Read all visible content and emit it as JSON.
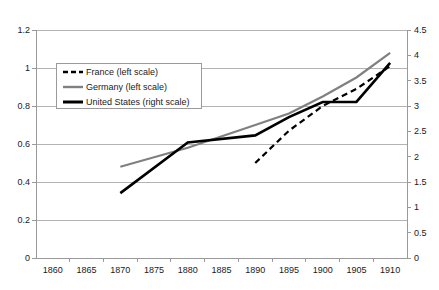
{
  "chart_data": {
    "type": "line",
    "title": "",
    "xlabel": "",
    "ylabel": "",
    "grid": true,
    "legend_position": "inside-upper-left",
    "x_axis": {
      "categories": [
        "1860",
        "1865",
        "1870",
        "1875",
        "1880",
        "1885",
        "1890",
        "1895",
        "1900",
        "1905",
        "1910"
      ],
      "tick_style": "between-categories"
    },
    "y_axis_left": {
      "label": "",
      "min": 0,
      "max": 1.2,
      "step": 0.2,
      "ticks": [
        "0",
        "0.2",
        "0.4",
        "0.6",
        "0.8",
        "1",
        "1.2"
      ]
    },
    "y_axis_right": {
      "label": "",
      "min": 0,
      "max": 4.5,
      "step": 0.5,
      "ticks": [
        "0",
        "0.5",
        "1",
        "1.5",
        "2",
        "2.5",
        "3",
        "3.5",
        "4",
        "4.5"
      ]
    },
    "series": [
      {
        "name": "France (left scale)",
        "axis": "left",
        "style": "dashed",
        "color": "#000000",
        "width": 2.2,
        "x": [
          1890,
          1895,
          1900,
          1905,
          1910
        ],
        "values": [
          0.5,
          0.67,
          0.8,
          0.89,
          1.01
        ]
      },
      {
        "name": "Germany (left scale)",
        "axis": "left",
        "style": "solid",
        "color": "#808080",
        "width": 2.2,
        "x": [
          1870,
          1880,
          1890,
          1895,
          1900,
          1905,
          1910
        ],
        "values": [
          0.48,
          0.58,
          0.7,
          0.76,
          0.85,
          0.95,
          1.08
        ]
      },
      {
        "name": "United States (right scale)",
        "axis": "right",
        "style": "solid",
        "color": "#000000",
        "width": 2.6,
        "x": [
          1870,
          1880,
          1890,
          1895,
          1900,
          1905,
          1910
        ],
        "values": [
          1.28,
          2.28,
          2.42,
          2.78,
          3.08,
          3.08,
          3.85
        ]
      }
    ]
  },
  "legend": {
    "items": [
      {
        "label": "France (left scale)",
        "icon": "dashed-line-swatch"
      },
      {
        "label": "Germany (left scale)",
        "icon": "gray-line-swatch"
      },
      {
        "label": "United States (right scale)",
        "icon": "black-line-swatch"
      }
    ]
  },
  "caption": {
    "text": ""
  },
  "colors": {
    "france": "#000000",
    "germany": "#808080",
    "united_states": "#000000",
    "grid": "#b3b3b3",
    "axis": "#9a9a9a",
    "text": "#1a1a1a"
  }
}
